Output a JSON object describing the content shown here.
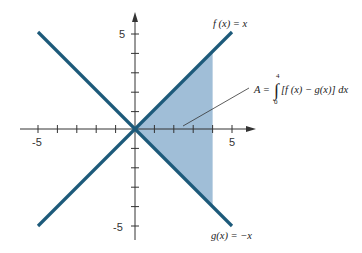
{
  "figure": {
    "type": "function-graph",
    "x_range": [
      -5,
      5
    ],
    "y_range": [
      -5,
      5
    ],
    "x_tick_labels": [
      "-5",
      "5"
    ],
    "y_tick_labels": [
      "5",
      "-5"
    ],
    "colors": {
      "line": "#1d5a7a",
      "fill": "#8fb3d0",
      "axis": "#333333"
    },
    "curves": [
      {
        "name": "f",
        "label": "f (x) = x",
        "expr": "x"
      },
      {
        "name": "g",
        "label": "g(x) = −x",
        "expr": "-x"
      }
    ],
    "shaded_region": {
      "from": 0,
      "to": 4
    },
    "annotation": {
      "lhs": "A = ",
      "integral_sign": "∫",
      "upper_limit": "4",
      "lower_limit": "0",
      "integrand": "[f (x) − g(x)] dx"
    }
  }
}
